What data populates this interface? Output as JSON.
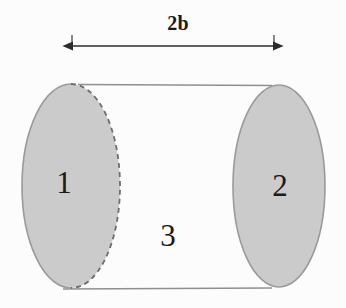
{
  "figure": {
    "background_color": "#fcfcfc",
    "dimension": {
      "label": "2b",
      "arrow_style": "double-headed",
      "span_start_x": 72,
      "span_end_x": 274,
      "arrow_y": 46,
      "label_x": 178,
      "label_y": 30,
      "tick_color": "#3a3a3a",
      "line_color": "#2b2b2b"
    },
    "shapes": [
      {
        "name": "ellipse-1",
        "label": "1",
        "cx": 71,
        "cy": 186,
        "rx": 49,
        "ry": 102,
        "fill": "#cbcbcb",
        "stroke": "#9a9a9a",
        "edge_style": "dashed-right",
        "label_x": 64,
        "label_y": 193
      },
      {
        "name": "ellipse-2",
        "label": "2",
        "cx": 279,
        "cy": 186,
        "rx": 46,
        "ry": 101,
        "fill": "#cbcbcb",
        "stroke": "#9a9a9a",
        "edge_style": "solid",
        "label_x": 280,
        "label_y": 196
      }
    ],
    "middle_region": {
      "name": "region-3",
      "label": "3",
      "label_x": 168,
      "label_y": 246,
      "fill": "#fcfcfc"
    },
    "connector_lines": [
      {
        "name": "top-connector",
        "x1": 78,
        "y1": 84,
        "x2": 272,
        "y2": 85,
        "color": "#8f8f8f"
      },
      {
        "name": "bottom-connector",
        "x1": 63,
        "y1": 289,
        "x2": 272,
        "y2": 288,
        "color": "#8f8f8f"
      }
    ],
    "colors": {
      "ellipse_fill": "#cbcbcb",
      "ellipse_stroke": "#9a9a9a",
      "line": "#8f8f8f",
      "text": "#1a1a1a",
      "background": "#fcfcfc"
    }
  }
}
